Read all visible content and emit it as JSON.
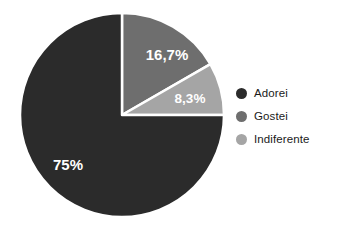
{
  "chart_data": {
    "type": "pie",
    "title": "",
    "categories": [
      "Adorei",
      "Gostei",
      "Indiferente"
    ],
    "values": [
      75,
      16.7,
      8.3
    ],
    "value_labels": [
      "75%",
      "16,7%",
      "8,3%"
    ],
    "colors": [
      "#2b2b2b",
      "#6e6e6e",
      "#a5a5a5"
    ],
    "slice_separator_color": "#ffffff",
    "label_text_color": "#ffffff",
    "background": "#ffffff",
    "start_angle_deg": 0,
    "direction": "clockwise",
    "legend_position": "right",
    "grid": false,
    "slices": [
      {
        "name": "Gostei",
        "value": 16.7,
        "label": "16,7%",
        "color": "#6e6e6e",
        "start_deg": 0,
        "end_deg": 60.12,
        "label_x": 167,
        "label_y": 56
      },
      {
        "name": "Indiferente",
        "value": 8.3,
        "label": "8,3%",
        "color": "#a5a5a5",
        "start_deg": 60.12,
        "end_deg": 90,
        "label_x": 190,
        "label_y": 99
      },
      {
        "name": "Adorei",
        "value": 75,
        "label": "75%",
        "color": "#2b2b2b",
        "start_deg": 90,
        "end_deg": 360,
        "label_x": 68,
        "label_y": 166
      }
    ],
    "geometry": {
      "center_x": 122,
      "center_y": 115,
      "radius": 102
    }
  },
  "legend": {
    "items": [
      {
        "label": "Adorei",
        "color": "#2b2b2b"
      },
      {
        "label": "Gostei",
        "color": "#6e6e6e"
      },
      {
        "label": "Indiferente",
        "color": "#a5a5a5"
      }
    ]
  }
}
